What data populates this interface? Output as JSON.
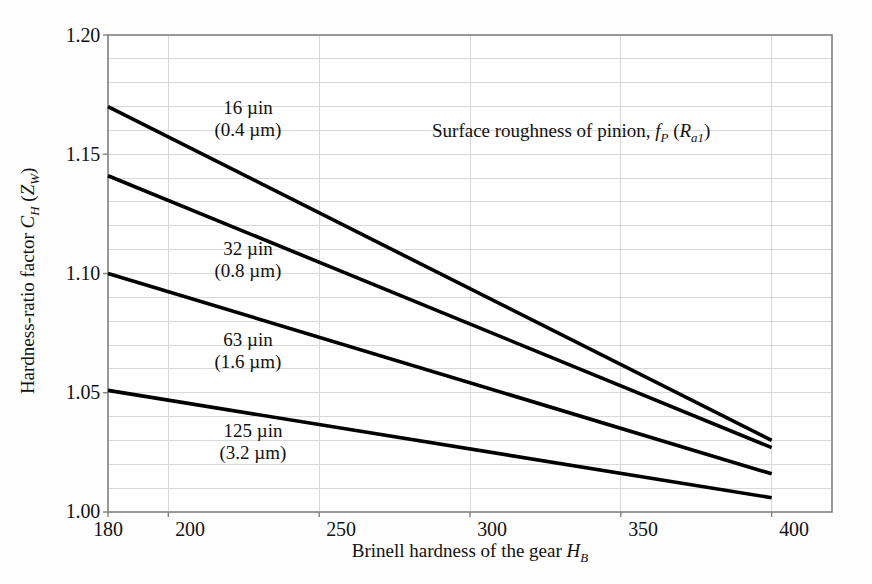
{
  "figure": {
    "background_color": "#fefefe",
    "plot_area": {
      "left": 108,
      "top": 35,
      "right": 832,
      "bottom": 512
    }
  },
  "axes": {
    "y": {
      "label_plain": "Hardness-ratio factor C_H (Z_W)",
      "ticks": [
        "1.00",
        "1.05",
        "1.10",
        "1.15",
        "1.20"
      ],
      "min": 1.0,
      "max": 1.2,
      "minor_step": 0.01
    },
    "x": {
      "label_plain": "Brinell hardness of the gear H_B",
      "ticks": [
        "180",
        "200",
        "250",
        "300",
        "350",
        "400"
      ],
      "tick_values": [
        180,
        200,
        250,
        300,
        350,
        400
      ],
      "min": 180,
      "max": 420
    }
  },
  "annotations": {
    "legend_note_plain": "Surface roughness of pinion, f_P (R_a1)"
  },
  "chart_data": {
    "type": "line",
    "title": "",
    "xlabel": "Brinell hardness of the gear H_B",
    "ylabel": "Hardness-ratio factor C_H (Z_W)",
    "xlim": [
      180,
      420
    ],
    "ylim": [
      1.0,
      1.2
    ],
    "grid": true,
    "legend_position": "inline-annotations",
    "line_color": "#000000",
    "grid_color": "#d9d9d9",
    "axis_color": "#808080",
    "series": [
      {
        "name": "16 µin (0.4 µm)",
        "label_line1": "16 µin",
        "label_line2": "(0.4 µm)",
        "x": [
          180,
          400
        ],
        "values": [
          1.17,
          1.03
        ]
      },
      {
        "name": "32 µin (0.8 µm)",
        "label_line1": "32 µin",
        "label_line2": "(0.8 µm)",
        "x": [
          180,
          400
        ],
        "values": [
          1.141,
          1.027
        ]
      },
      {
        "name": "63 µin (1.6 µm)",
        "label_line1": "63 µin",
        "label_line2": "(1.6 µm)",
        "x": [
          180,
          400
        ],
        "values": [
          1.1,
          1.016
        ]
      },
      {
        "name": "125 µin (3.2 µm)",
        "label_line1": "125 µin",
        "label_line2": "(3.2 µm)",
        "x": [
          180,
          400
        ],
        "values": [
          1.051,
          1.006
        ]
      }
    ]
  },
  "ytick_labels": {
    "t0": "1.00",
    "t1": "1.05",
    "t2": "1.10",
    "t3": "1.15",
    "t4": "1.20"
  },
  "xtick_labels": {
    "t0": "180",
    "t1": "200",
    "t2": "250",
    "t3": "300",
    "t4": "350",
    "t5": "400"
  },
  "series_labels": {
    "s0_l1": "16 µin",
    "s0_l2": "(0.4 µm)",
    "s1_l1": "32 µin",
    "s1_l2": "(0.8 µm)",
    "s2_l1": "63 µin",
    "s2_l2": "(1.6 µm)",
    "s3_l1": "125 µin",
    "s3_l2": "(3.2 µm)"
  }
}
